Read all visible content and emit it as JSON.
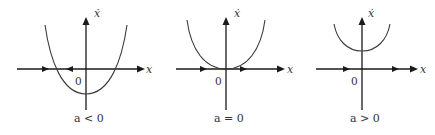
{
  "figure": {
    "colors": {
      "axis": "#1a1a1a",
      "curve": "#3a3a3a",
      "text": "#333333",
      "background": "#ffffff"
    },
    "panels": [
      {
        "id": "a-negative",
        "caption": "a < 0",
        "x_axis_label": "x",
        "y_axis_label": "ẋ",
        "origin_label": "0",
        "curve": "parabola crossing x-axis at two points (vertex below axis)",
        "flow_arrows": [
          "right",
          "left",
          "right"
        ]
      },
      {
        "id": "a-zero",
        "caption": "a = 0",
        "x_axis_label": "x",
        "y_axis_label": "ẋ",
        "origin_label": "0",
        "curve": "parabola tangent to x-axis at origin",
        "flow_arrows": [
          "right",
          "right"
        ]
      },
      {
        "id": "a-positive",
        "caption": "a > 0",
        "x_axis_label": "x",
        "y_axis_label": "ẋ",
        "origin_label": "0",
        "curve": "parabola entirely above x-axis",
        "flow_arrows": [
          "right",
          "right"
        ]
      }
    ]
  }
}
